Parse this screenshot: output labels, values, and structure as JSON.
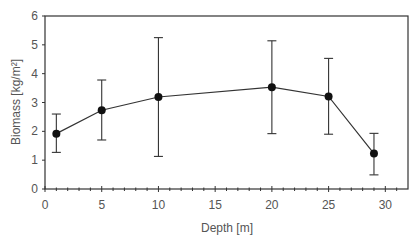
{
  "chart_data": {
    "type": "line",
    "title": "",
    "xlabel": "Depth [m]",
    "ylabel": "Biomass [kg/m²]",
    "xlim": [
      0,
      32
    ],
    "ylim": [
      0,
      6
    ],
    "x_ticks": [
      0,
      5,
      10,
      15,
      20,
      25,
      30
    ],
    "y_ticks": [
      0,
      1,
      2,
      3,
      4,
      5,
      6
    ],
    "x_minor_step": 1,
    "grid": false,
    "legend": null,
    "series": [
      {
        "name": "Biomass",
        "x": [
          1,
          5,
          10,
          20,
          25,
          29
        ],
        "values": [
          1.92,
          2.73,
          3.19,
          3.53,
          3.21,
          1.23
        ],
        "error_upper": [
          2.6,
          3.78,
          5.25,
          5.14,
          4.53,
          1.93
        ],
        "error_lower": [
          1.27,
          1.7,
          1.13,
          1.92,
          1.9,
          0.49
        ],
        "marker": "filled-circle",
        "color": "#1a1a1a"
      }
    ]
  },
  "colors": {
    "axis": "#333333",
    "line": "#333333",
    "marker": "#111111",
    "text": "#555555"
  }
}
